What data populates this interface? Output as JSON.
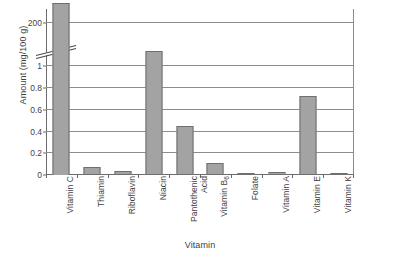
{
  "chart_data": {
    "type": "bar",
    "title": "",
    "xlabel": "Vitamin",
    "ylabel": "Amount (mg/100 g)",
    "categories": [
      "Vitamin C",
      "Thiamin",
      "Riboflavin",
      "Niacin",
      "Pantothenic Acid",
      "Vitamin B6",
      "Folate",
      "Vitamin A",
      "Vitamin E",
      "Vitamin K"
    ],
    "values": [
      228,
      0.07,
      0.04,
      1.06,
      0.45,
      0.11,
      0.005,
      0.03,
      0.73,
      0.005
    ],
    "ytick_labels": [
      "0",
      "0.2",
      "0.4",
      "0.6",
      "0.8",
      "1",
      "200"
    ],
    "ytick_values": [
      0,
      0.2,
      0.4,
      0.6,
      0.8,
      1,
      200
    ],
    "ylim": [
      0,
      200
    ],
    "axis_break": {
      "present": true,
      "between": [
        1,
        200
      ],
      "note": "scale break on y-axis between 1 and 200"
    },
    "grid": true,
    "legend": false,
    "bar_fill_color": "#a3a3a3",
    "bar_border_color": "#6f6f6f",
    "gridline_color": "#8c8c8c",
    "axis_color": "#6b6b6b",
    "background_color": "#ffffff",
    "text_color": "#3f3f3f"
  },
  "axis_labels": {
    "categories_display": [
      "Vitamin C",
      "Thiamin",
      "Riboflavin",
      "Niacin",
      "Pantothenic\nAcid",
      "Vitamin B",
      "Folate",
      "Vitamin A",
      "Vitamin E",
      "Vitamin K"
    ],
    "b6_subscript": "6"
  }
}
